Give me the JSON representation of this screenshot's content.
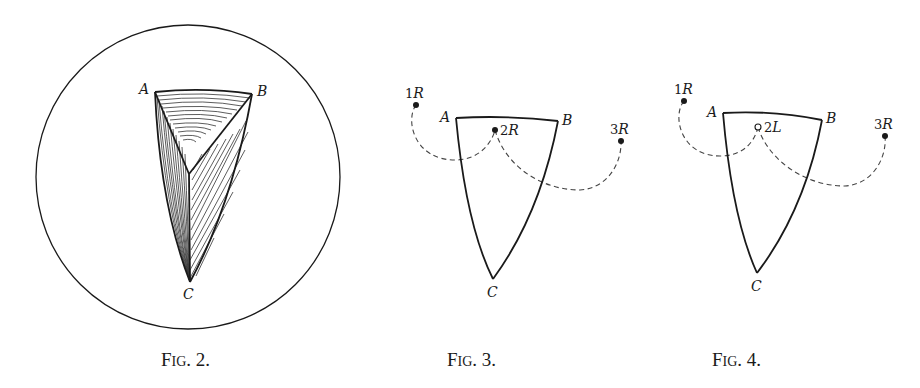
{
  "figures": [
    {
      "id": "fig2",
      "caption": {
        "prefix": "F",
        "smallcaps": "IG",
        "number": ". 2."
      },
      "labels": {
        "a": "A",
        "b": "B",
        "c": "C"
      }
    },
    {
      "id": "fig3",
      "caption": {
        "prefix": "F",
        "smallcaps": "IG",
        "number": ". 3."
      },
      "labels": {
        "a": "A",
        "b": "B",
        "c": "C"
      },
      "points": [
        {
          "num": "1",
          "letter": "R",
          "filled": true
        },
        {
          "num": "2",
          "letter": "R",
          "filled": true
        },
        {
          "num": "3",
          "letter": "R",
          "filled": true
        }
      ]
    },
    {
      "id": "fig4",
      "caption": {
        "prefix": "F",
        "smallcaps": "IG",
        "number": ". 4."
      },
      "labels": {
        "a": "A",
        "b": "B",
        "c": "C"
      },
      "points": [
        {
          "num": "1",
          "letter": "R",
          "filled": true
        },
        {
          "num": "2",
          "letter": "L",
          "filled": false
        },
        {
          "num": "3",
          "letter": "R",
          "filled": true
        }
      ]
    }
  ]
}
